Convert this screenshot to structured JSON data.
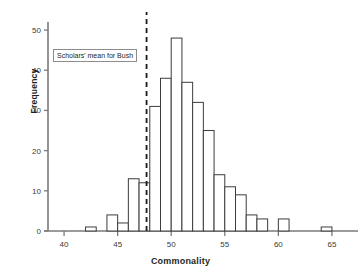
{
  "chart_data": {
    "type": "bar",
    "title": "",
    "subtitle": "",
    "xlabel": "Commonality",
    "ylabel": "Frequency",
    "xlim": [
      38.5,
      66.5
    ],
    "ylim": [
      0,
      52
    ],
    "grid": false,
    "legend": null,
    "bin_width": 1,
    "categories": [
      "39-40",
      "40-41",
      "41-42",
      "42-43",
      "43-44",
      "44-45",
      "45-46",
      "46-47",
      "47-48",
      "48-49",
      "49-50",
      "50-51",
      "51-52",
      "52-53",
      "53-54",
      "54-55",
      "55-56",
      "56-57",
      "57-58",
      "58-59",
      "59-60",
      "60-61",
      "61-62",
      "62-63",
      "63-64",
      "64-65"
    ],
    "bin_starts": [
      39,
      40,
      41,
      42,
      43,
      44,
      45,
      46,
      47,
      48,
      49,
      50,
      51,
      52,
      53,
      54,
      55,
      56,
      57,
      58,
      59,
      60,
      61,
      62,
      63,
      64
    ],
    "values": [
      0,
      0,
      0,
      1,
      0,
      4,
      2,
      13,
      12,
      31,
      38,
      48,
      37,
      32,
      25,
      14,
      11,
      9,
      4,
      3,
      0,
      3,
      0,
      0,
      0,
      1
    ],
    "xticks": [
      40,
      45,
      50,
      55,
      60,
      65
    ],
    "xtick_labels": [
      "40",
      "45",
      "50",
      "55",
      "60",
      "65"
    ],
    "yticks": [
      0,
      10,
      20,
      30,
      40,
      50
    ],
    "ytick_labels": [
      "0",
      "10",
      "20",
      "30",
      "40",
      "50"
    ],
    "annotations": [
      {
        "name": "scholars-mean-line",
        "label": "Scholars' mean for Bush",
        "x_value": 47.7,
        "style": "dashed-vertical-line"
      }
    ],
    "colors": {
      "bar_stroke": "#3c3c3c",
      "bar_fill": "#ffffff",
      "axis": "#7a7a7a",
      "text": "#231f20",
      "annotation_border": "#8d8d8d",
      "reference_line": "#1a1a1a"
    }
  },
  "axes": {
    "x_title": "Commonality",
    "y_title": "Frequency"
  },
  "annotation_box": {
    "text": "Scholars' mean for Bush"
  }
}
